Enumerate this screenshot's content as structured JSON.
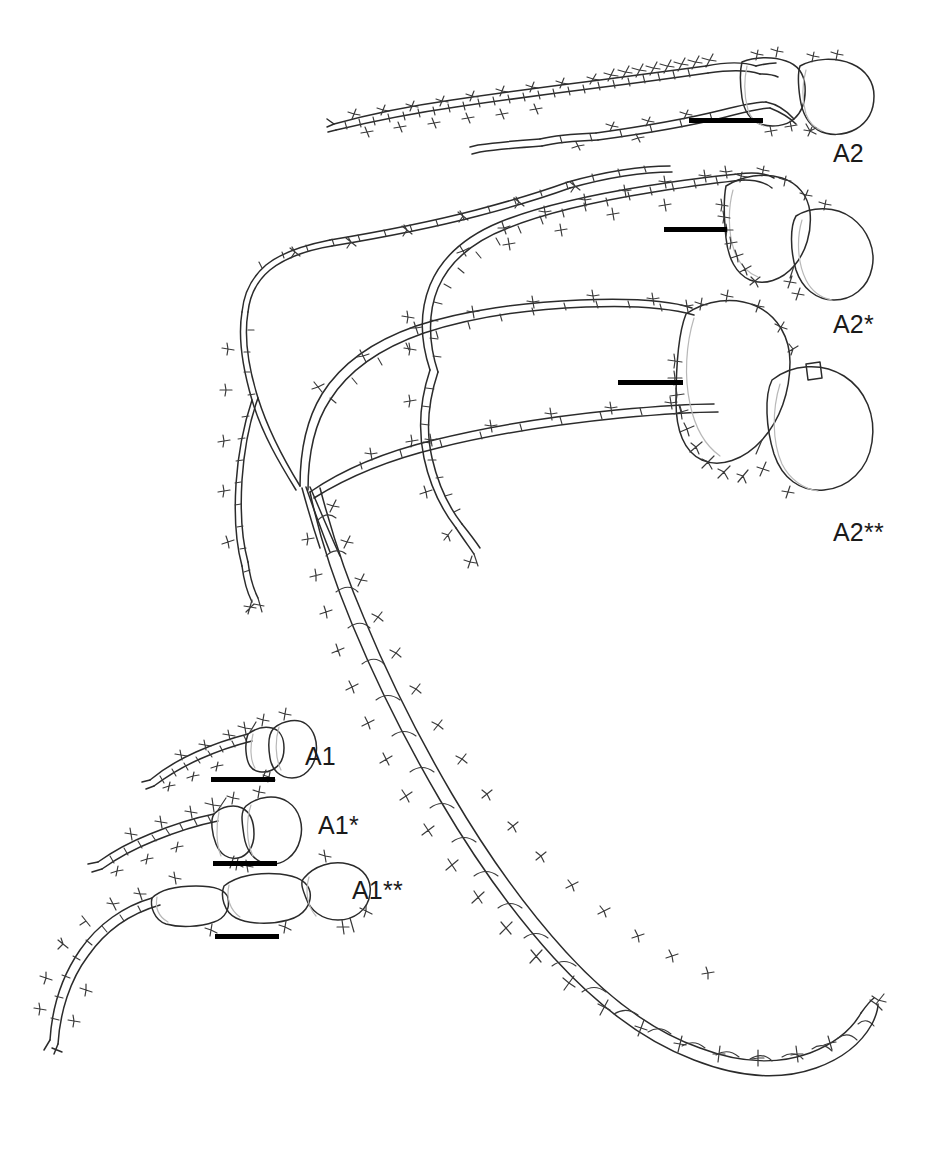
{
  "figure": {
    "kind": "scientific-line-drawing",
    "background_color": "#ffffff",
    "ink_color": "#2b2b2b",
    "scalebar_color": "#000000",
    "width": 930,
    "height": 1151
  },
  "labels": [
    {
      "id": "a2",
      "text": "A2",
      "x": 833,
      "y": 139
    },
    {
      "id": "a2-star",
      "text": "A2*",
      "x": 833,
      "y": 310
    },
    {
      "id": "a2-2star",
      "text": "A2**",
      "x": 833,
      "y": 518
    },
    {
      "id": "a1",
      "text": "A1",
      "x": 305,
      "y": 742
    },
    {
      "id": "a1-star",
      "text": "A1*",
      "x": 318,
      "y": 811
    },
    {
      "id": "a1-2star",
      "text": "A1**",
      "x": 352,
      "y": 876
    }
  ],
  "scale_bars": [
    {
      "id": "bar-a2",
      "for": "A2",
      "x": 689,
      "y": 118,
      "width": 74
    },
    {
      "id": "bar-a2-star",
      "for": "A2*",
      "x": 664,
      "y": 227,
      "width": 63
    },
    {
      "id": "bar-a2-2star",
      "for": "A2**",
      "x": 618,
      "y": 380,
      "width": 65
    },
    {
      "id": "bar-a1",
      "for": "A1",
      "x": 211,
      "y": 777,
      "width": 64
    },
    {
      "id": "bar-a1-star",
      "for": "A1*",
      "x": 213,
      "y": 861,
      "width": 64
    },
    {
      "id": "bar-a1-2star",
      "for": "A1**",
      "x": 215,
      "y": 934,
      "width": 64
    }
  ],
  "specimens": [
    {
      "id": "A2",
      "name": "antenna",
      "variant": "type",
      "peduncle_articles": 2,
      "flagellum_segments": 26
    },
    {
      "id": "A2*",
      "name": "antenna",
      "variant": "single-asterisk",
      "peduncle_articles": 2,
      "flagellum_segments": 28
    },
    {
      "id": "A2**",
      "name": "antenna",
      "variant": "double-asterisk",
      "peduncle_articles": 2,
      "flagellum_segments": 48
    },
    {
      "id": "A1",
      "name": "antennule",
      "variant": "type",
      "peduncle_articles": 3,
      "flagellum_segments": 9
    },
    {
      "id": "A1*",
      "name": "antennule",
      "variant": "single-asterisk",
      "peduncle_articles": 3,
      "flagellum_segments": 10
    },
    {
      "id": "A1**",
      "name": "antennule",
      "variant": "double-asterisk",
      "peduncle_articles": 3,
      "flagellum_segments": 14
    }
  ]
}
